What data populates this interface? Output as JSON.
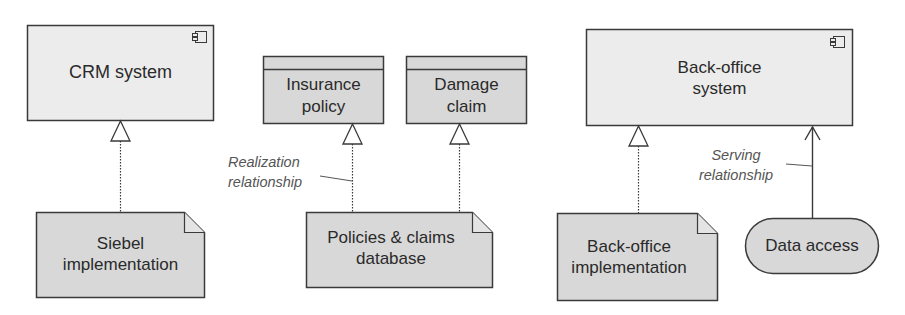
{
  "diagram": {
    "type": "ArchiMate realization and serving relationships",
    "colors": {
      "background": "#ffffff",
      "element_fill_light": "#ececec",
      "element_fill_dark": "#d6d6d6",
      "stroke": "#3a3a3a",
      "annotation_text": "#555555"
    },
    "elements": {
      "crm_system": {
        "label": "CRM system",
        "kind": "application-component",
        "icon": "component-icon"
      },
      "siebel_impl": {
        "label_line1": "Siebel",
        "label_line2": "implementation",
        "kind": "artifact"
      },
      "insurance_policy": {
        "label_line1": "Insurance",
        "label_line2": "policy",
        "kind": "business-object"
      },
      "damage_claim": {
        "label_line1": "Damage",
        "label_line2": "claim",
        "kind": "business-object"
      },
      "policies_db": {
        "label_line1": "Policies & claims",
        "label_line2": "database",
        "kind": "artifact"
      },
      "backoffice_system": {
        "label_line1": "Back-office",
        "label_line2": "system",
        "kind": "application-component",
        "icon": "component-icon"
      },
      "backoffice_impl": {
        "label_line1": "Back-office",
        "label_line2": "implementation",
        "kind": "artifact"
      },
      "data_access": {
        "label": "Data access",
        "kind": "application-service"
      }
    },
    "annotations": {
      "realization": {
        "line1": "Realization",
        "line2": "relationship"
      },
      "serving": {
        "line1": "Serving",
        "line2": "relationship"
      }
    },
    "relationships": [
      {
        "from": "Siebel implementation",
        "to": "CRM system",
        "type": "realization"
      },
      {
        "from": "Policies & claims database",
        "to": "Insurance policy",
        "type": "realization"
      },
      {
        "from": "Policies & claims database",
        "to": "Damage claim",
        "type": "realization"
      },
      {
        "from": "Back-office implementation",
        "to": "Back-office system",
        "type": "realization"
      },
      {
        "from": "Data access",
        "to": "Back-office system",
        "type": "serving"
      }
    ]
  }
}
